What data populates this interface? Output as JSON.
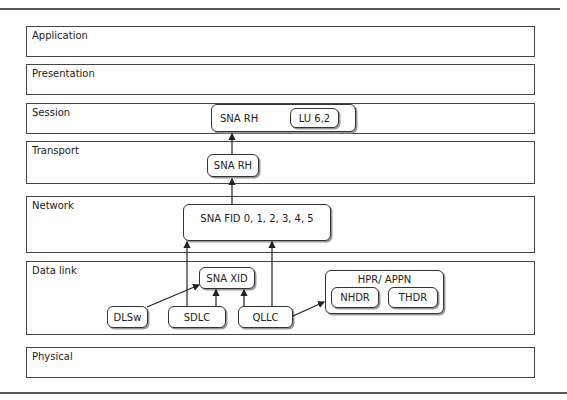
{
  "layers": [
    {
      "label": "Application"
    },
    {
      "label": "Presentation"
    },
    {
      "label": "Session"
    },
    {
      "label": "Transport"
    },
    {
      "label": "Network"
    },
    {
      "label": "Data link"
    },
    {
      "label": "Physical"
    }
  ],
  "nodes": {
    "session_sna_rh": "SNA RH",
    "lu62": "LU 6,2",
    "transport_sna_rh": "SNA RH",
    "sna_fid": "SNA FID 0, 1, 2, 3, 4, 5",
    "sna_xid": "SNA XID",
    "dlsw": "DLSw",
    "sdlc": "SDLC",
    "qllc": "QLLC",
    "hpr_appn": "HPR/ APPN",
    "nhdr": "NHDR",
    "thdr": "THDR"
  },
  "colors": {
    "line": "#333333",
    "border": "#444444",
    "background": "#ffffff"
  }
}
